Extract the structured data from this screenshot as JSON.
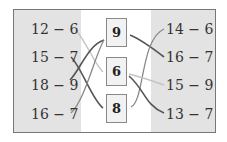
{
  "left_expressions": [
    "12 − 6",
    "15 − 7",
    "18 − 9",
    "16 − 7"
  ],
  "answers": [
    "9",
    "6",
    "8"
  ],
  "right_expressions": [
    "14 − 6",
    "16 − 7",
    "15 − 9",
    "13 − 7"
  ],
  "colors": {
    "panel": "#e3e3e3",
    "dark_line": "#555555",
    "mid_line": "#888888",
    "light_line": "#c4c4c4"
  }
}
